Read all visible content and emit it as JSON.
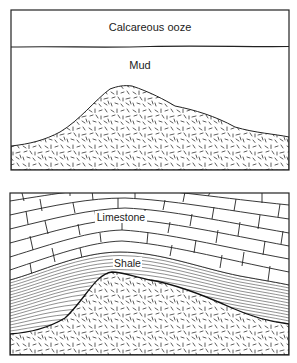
{
  "diagram": {
    "type": "geologic cross-section",
    "panels": [
      {
        "id": "top",
        "description": "Before burial: igneous mound covered by mud and calcareous ooze",
        "layers": [
          {
            "name": "calcareous-ooze",
            "label": "Calcareous ooze"
          },
          {
            "name": "mud",
            "label": "Mud"
          },
          {
            "name": "igneous-basement",
            "label": ""
          }
        ]
      },
      {
        "id": "bottom",
        "description": "After compaction: shale and limestone draped over mound",
        "layers": [
          {
            "name": "limestone",
            "label": "Limestone"
          },
          {
            "name": "shale",
            "label": "Shale"
          },
          {
            "name": "igneous-basement",
            "label": ""
          }
        ]
      }
    ]
  },
  "top": {
    "ooze_label": "Calcareous ooze",
    "mud_label": "Mud"
  },
  "bottom": {
    "limestone_label": "Limestone",
    "shale_label": "Shale"
  },
  "colors": {
    "stroke": "#222222",
    "background": "#ffffff"
  }
}
